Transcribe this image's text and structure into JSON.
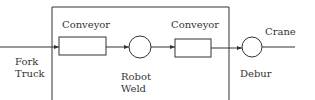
{
  "diagram": {
    "stroke_color": "#333333",
    "labels": {
      "input_line1": "Fork",
      "input_line2": "Truck",
      "conveyor1": "Conveyor",
      "station1_line1": "Robot",
      "station1_line2": "Weld",
      "conveyor2": "Conveyor",
      "station2": "Debur",
      "output": "Crane"
    }
  }
}
